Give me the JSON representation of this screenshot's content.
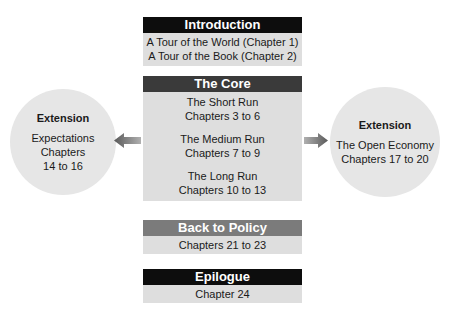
{
  "introduction": {
    "title": "Introduction",
    "lines": [
      "A Tour of the World (Chapter 1)",
      "A Tour of the Book (Chapter 2)"
    ]
  },
  "core": {
    "title": "The Core",
    "groups": [
      {
        "name": "The Short Run",
        "chapters": "Chapters 3 to 6"
      },
      {
        "name": "The Medium Run",
        "chapters": "Chapters 7 to 9"
      },
      {
        "name": "The Long Run",
        "chapters": "Chapters 10 to 13"
      }
    ]
  },
  "policy": {
    "title": "Back to Policy",
    "chapters": "Chapters 21 to 23"
  },
  "epilogue": {
    "title": "Epilogue",
    "chapters": "Chapter 24"
  },
  "extension_left": {
    "title": "Extension",
    "lines": [
      "Expectations",
      "Chapters",
      "14 to 16"
    ]
  },
  "extension_right": {
    "title": "Extension",
    "lines": [
      "The Open Economy",
      "Chapters 17 to 20"
    ]
  },
  "colors": {
    "header_dark": "#0d0d0d",
    "header_core": "#3a3a3a",
    "header_policy": "#7b7b7b",
    "body_fill": "#dedede",
    "circle_fill": "#e6e6e6",
    "arrow": "#808080"
  }
}
